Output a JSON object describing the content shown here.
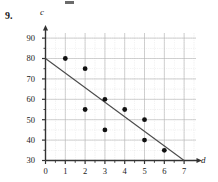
{
  "problem": {
    "number": "9."
  },
  "chart_data": {
    "type": "scatter",
    "title": "",
    "xlabel": "d",
    "ylabel": "c",
    "xlim": [
      0,
      7.6
    ],
    "ylim": [
      30,
      93
    ],
    "grid": true,
    "legend": "none",
    "x_ticks": [
      "0",
      "1",
      "2",
      "3",
      "4",
      "5",
      "6",
      "7"
    ],
    "x_tick_values": [
      0,
      1,
      2,
      3,
      4,
      5,
      6,
      7
    ],
    "y_ticks": [
      "30",
      "40",
      "50",
      "60",
      "70",
      "80",
      "90"
    ],
    "y_tick_values": [
      30,
      40,
      50,
      60,
      70,
      80,
      90
    ],
    "x_minor_step": 0.5,
    "y_minor_step": 5,
    "points": [
      {
        "x": 1,
        "y": 80
      },
      {
        "x": 2,
        "y": 75
      },
      {
        "x": 2,
        "y": 55
      },
      {
        "x": 3,
        "y": 60
      },
      {
        "x": 3,
        "y": 45
      },
      {
        "x": 4,
        "y": 55
      },
      {
        "x": 5,
        "y": 50
      },
      {
        "x": 5,
        "y": 40
      },
      {
        "x": 6,
        "y": 35
      }
    ],
    "trend_line": {
      "name": "line of best fit",
      "x0": 0,
      "y0": 80,
      "x1": 7,
      "y1": 30
    },
    "colors": {
      "point": "#111111",
      "line": "#4a4a4a",
      "axis": "#333333",
      "grid": "#c8c8c8",
      "background": "#ffffff"
    }
  }
}
